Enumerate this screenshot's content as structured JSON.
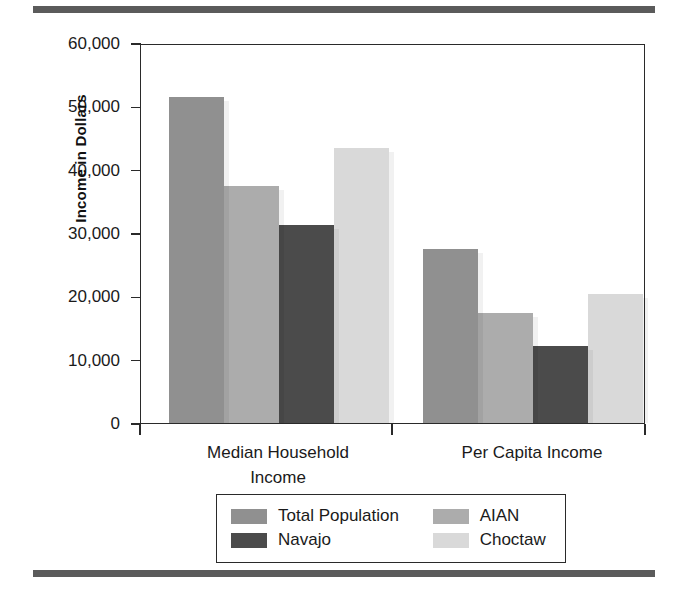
{
  "chart_data": {
    "type": "bar",
    "title": "",
    "xlabel": "",
    "ylabel": "Income in Dollars",
    "categories": [
      "Median Household\nIncome",
      "Per Capita Income"
    ],
    "ylim": [
      0,
      60000
    ],
    "ytick_labels": [
      "60,000",
      "50,000",
      "40,000",
      "30,000",
      "20,000",
      "10,000",
      "0"
    ],
    "ytick_values": [
      60000,
      50000,
      40000,
      30000,
      20000,
      10000,
      0
    ],
    "grid": true,
    "legend_position": "bottom",
    "series": [
      {
        "name": "Total Population",
        "color": "#909090",
        "values": [
          51400,
          27400
        ]
      },
      {
        "name": "AIAN",
        "color": "#acacac",
        "values": [
          37500,
          17400
        ]
      },
      {
        "name": "Navajo",
        "color": "#4b4b4b",
        "values": [
          31200,
          12200
        ]
      },
      {
        "name": "Choctaw",
        "color": "#d9d9d9",
        "values": [
          43500,
          20400
        ]
      }
    ]
  },
  "legend": {
    "entries": [
      {
        "label": "Total Population",
        "color": "#909090"
      },
      {
        "label": "AIAN",
        "color": "#acacac"
      },
      {
        "label": "Navajo",
        "color": "#4b4b4b"
      },
      {
        "label": "Choctaw",
        "color": "#d9d9d9"
      }
    ]
  },
  "axes": {
    "y_title": "Income in Dollars"
  },
  "style": {
    "rule_color": "#5b5b5b",
    "frame_color": "#2a2a2a",
    "text_color": "#1a1a1a"
  }
}
